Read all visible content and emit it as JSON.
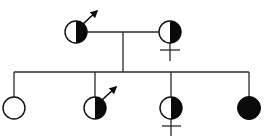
{
  "diagram": {
    "type": "pedigree",
    "colors": {
      "background": "#ffffff",
      "line": "#2a2a2a",
      "filled": "#0a0a0a"
    },
    "generations": [
      {
        "level": 1,
        "members": [
          {
            "id": "parent-1",
            "sex_symbol": "male",
            "fill": "half",
            "filled_side": "right"
          },
          {
            "id": "parent-2",
            "sex_symbol": "female",
            "fill": "half",
            "filled_side": "right"
          }
        ]
      },
      {
        "level": 2,
        "members": [
          {
            "id": "child-1",
            "sex_symbol": "none",
            "fill": "empty"
          },
          {
            "id": "child-2",
            "sex_symbol": "male",
            "fill": "half",
            "filled_side": "right"
          },
          {
            "id": "child-3",
            "sex_symbol": "female",
            "fill": "half",
            "filled_side": "right"
          },
          {
            "id": "child-4",
            "sex_symbol": "none",
            "fill": "full"
          }
        ]
      }
    ],
    "relationships": [
      {
        "type": "mating",
        "between": [
          "parent-1",
          "parent-2"
        ]
      },
      {
        "type": "sibship",
        "children": [
          "child-1",
          "child-2",
          "child-3",
          "child-4"
        ]
      }
    ]
  }
}
